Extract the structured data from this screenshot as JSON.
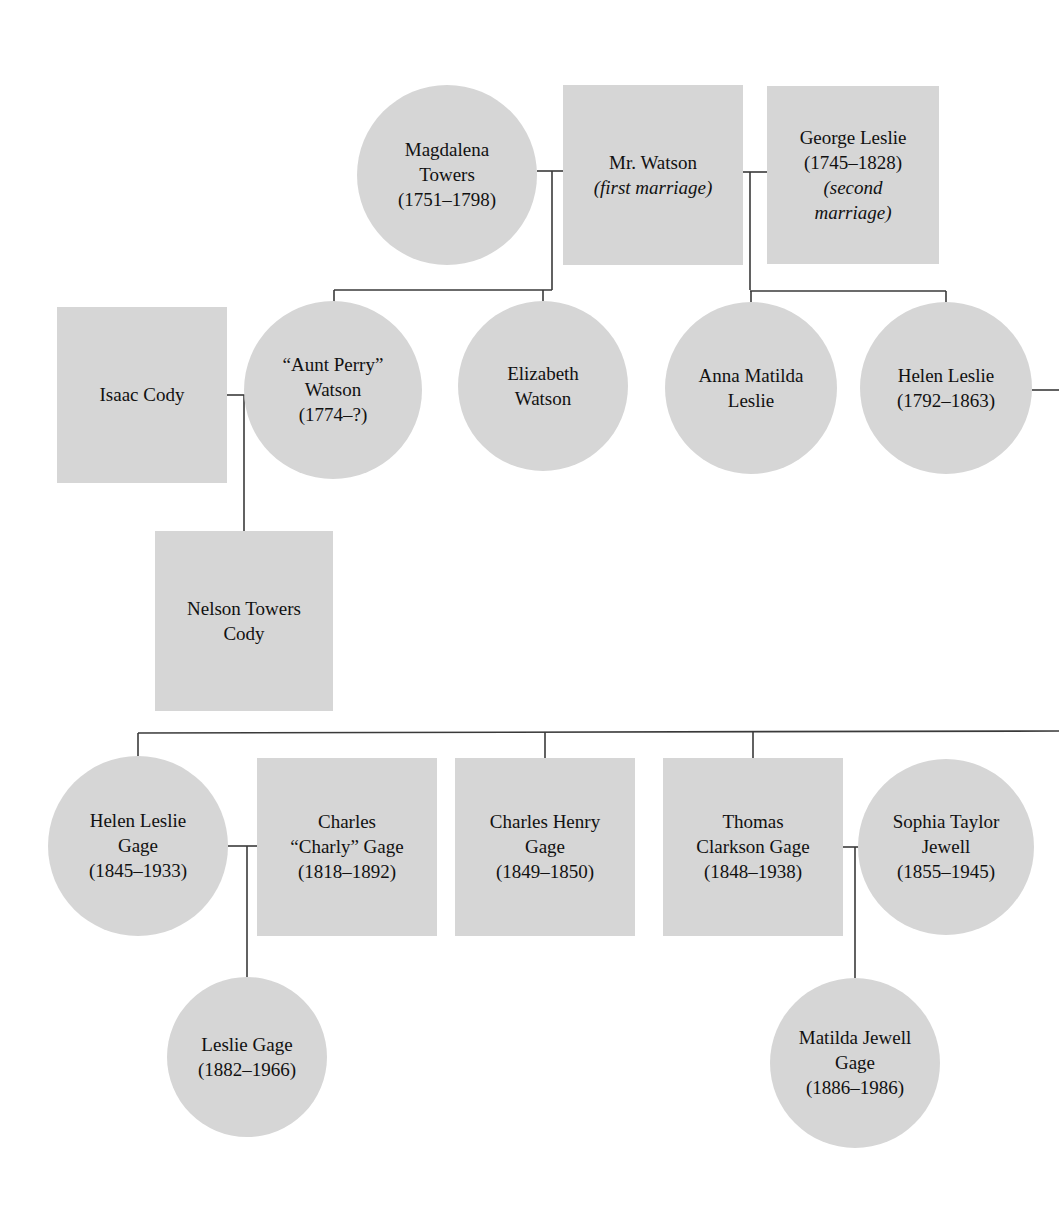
{
  "diagram": {
    "type": "genealogy-tree",
    "background_color": "#ffffff",
    "node_fill_color": "#d6d6d6",
    "connector_color": "#3a3a3a",
    "text_color": "#111111"
  },
  "nodes": [
    {
      "id": "magdalena-towers",
      "shape": "circle",
      "cx": 447,
      "cy": 175,
      "r": 90,
      "lines": [
        {
          "text": "Magdalena",
          "italic": false
        },
        {
          "text": "Towers",
          "italic": false
        },
        {
          "text": "(1751–1798)",
          "italic": false
        }
      ]
    },
    {
      "id": "mr-watson",
      "shape": "rect",
      "x": 563,
      "y": 85,
      "w": 180,
      "h": 180,
      "lines": [
        {
          "text": "Mr. Watson",
          "italic": false
        },
        {
          "text": "(first marriage)",
          "italic": true
        }
      ]
    },
    {
      "id": "george-leslie",
      "shape": "rect",
      "x": 767,
      "y": 86,
      "w": 172,
      "h": 178,
      "lines": [
        {
          "text": "George Leslie",
          "italic": false
        },
        {
          "text": "(1745–1828)",
          "italic": false
        },
        {
          "text": "(second",
          "italic": true
        },
        {
          "text": "marriage)",
          "italic": true
        }
      ]
    },
    {
      "id": "isaac-cody",
      "shape": "rect",
      "x": 57,
      "y": 307,
      "w": 170,
      "h": 176,
      "lines": [
        {
          "text": "Isaac Cody",
          "italic": false
        }
      ]
    },
    {
      "id": "aunt-perry-watson",
      "shape": "circle",
      "cx": 333,
      "cy": 390,
      "r": 89,
      "lines": [
        {
          "text": "“Aunt Perry”",
          "italic": false
        },
        {
          "text": "Watson",
          "italic": false
        },
        {
          "text": "(1774–?)",
          "italic": false
        }
      ]
    },
    {
      "id": "elizabeth-watson",
      "shape": "circle",
      "cx": 543,
      "cy": 386,
      "r": 85,
      "lines": [
        {
          "text": "Elizabeth",
          "italic": false
        },
        {
          "text": "Watson",
          "italic": false
        }
      ]
    },
    {
      "id": "anna-matilda-leslie",
      "shape": "circle",
      "cx": 751,
      "cy": 388,
      "r": 86,
      "lines": [
        {
          "text": "Anna Matilda",
          "italic": false
        },
        {
          "text": "Leslie",
          "italic": false
        }
      ]
    },
    {
      "id": "helen-leslie",
      "shape": "circle",
      "cx": 946,
      "cy": 388,
      "r": 86,
      "lines": [
        {
          "text": "Helen Leslie",
          "italic": false
        },
        {
          "text": "(1792–1863)",
          "italic": false
        }
      ]
    },
    {
      "id": "nelson-towers-cody",
      "shape": "rect",
      "x": 155,
      "y": 531,
      "w": 178,
      "h": 180,
      "lines": [
        {
          "text": "Nelson Towers",
          "italic": false
        },
        {
          "text": "Cody",
          "italic": false
        }
      ]
    },
    {
      "id": "helen-leslie-gage",
      "shape": "circle",
      "cx": 138,
      "cy": 846,
      "r": 90,
      "lines": [
        {
          "text": "Helen Leslie",
          "italic": false
        },
        {
          "text": "Gage",
          "italic": false
        },
        {
          "text": "(1845–1933)",
          "italic": false
        }
      ]
    },
    {
      "id": "charles-charly-gage",
      "shape": "rect",
      "x": 257,
      "y": 758,
      "w": 180,
      "h": 178,
      "lines": [
        {
          "text": "Charles",
          "italic": false
        },
        {
          "text": "“Charly” Gage",
          "italic": false
        },
        {
          "text": "(1818–1892)",
          "italic": false
        }
      ]
    },
    {
      "id": "charles-henry-gage",
      "shape": "rect",
      "x": 455,
      "y": 758,
      "w": 180,
      "h": 178,
      "lines": [
        {
          "text": "Charles Henry",
          "italic": false
        },
        {
          "text": "Gage",
          "italic": false
        },
        {
          "text": "(1849–1850)",
          "italic": false
        }
      ]
    },
    {
      "id": "thomas-clarkson-gage",
      "shape": "rect",
      "x": 663,
      "y": 758,
      "w": 180,
      "h": 178,
      "lines": [
        {
          "text": "Thomas",
          "italic": false
        },
        {
          "text": "Clarkson Gage",
          "italic": false
        },
        {
          "text": "(1848–1938)",
          "italic": false
        }
      ]
    },
    {
      "id": "sophia-taylor-jewell",
      "shape": "circle",
      "cx": 946,
      "cy": 847,
      "r": 88,
      "lines": [
        {
          "text": "Sophia Taylor",
          "italic": false
        },
        {
          "text": "Jewell",
          "italic": false
        },
        {
          "text": "(1855–1945)",
          "italic": false
        }
      ]
    },
    {
      "id": "leslie-gage",
      "shape": "circle",
      "cx": 247,
      "cy": 1057,
      "r": 80,
      "lines": [
        {
          "text": "Leslie Gage",
          "italic": false
        },
        {
          "text": "(1882–1966)",
          "italic": false
        }
      ]
    },
    {
      "id": "matilda-jewell-gage",
      "shape": "circle",
      "cx": 855,
      "cy": 1063,
      "r": 85,
      "lines": [
        {
          "text": "Matilda Jewell",
          "italic": false
        },
        {
          "text": "Gage",
          "italic": false
        },
        {
          "text": "(1886–1986)",
          "italic": false
        }
      ]
    }
  ],
  "connectors": [
    {
      "id": "marriage-magdalena-watson",
      "d": "M 537 171 L 563 171"
    },
    {
      "id": "marriage-watson-drop",
      "d": "M 552 171 L 552 290"
    },
    {
      "id": "marriage-watson-george",
      "d": "M 742 172 L 767 172"
    },
    {
      "id": "marriage-george-drop",
      "d": "M 750 172 L 750 290"
    },
    {
      "id": "watson-children-bar",
      "d": "M 334 290 L 552 290"
    },
    {
      "id": "watson-child-aunt-perry-drop",
      "d": "M 334 290 L 334 303"
    },
    {
      "id": "watson-child-elizabeth-drop",
      "d": "M 543 290 L 543 302"
    },
    {
      "id": "leslie-children-bar",
      "d": "M 750 291 L 946 291"
    },
    {
      "id": "leslie-child-anna-drop",
      "d": "M 751 291 L 751 303"
    },
    {
      "id": "leslie-child-helen-drop",
      "d": "M 946 291 L 946 303"
    },
    {
      "id": "helen-leslie-right-stub",
      "d": "M 1032 390 L 1059 390"
    },
    {
      "id": "marriage-isaac-auntperry",
      "d": "M 227 395 L 245 395"
    },
    {
      "id": "marriage-cody-drop",
      "d": "M 244 395 L 244 531"
    },
    {
      "id": "gage-children-bar",
      "d": "M 138 733 L 1059 731"
    },
    {
      "id": "gage-child-helen-drop",
      "d": "M 138 733 L 138 758"
    },
    {
      "id": "gage-child-charlesh-drop",
      "d": "M 545 732 L 545 758"
    },
    {
      "id": "gage-child-thomas-drop",
      "d": "M 753 732 L 753 758"
    },
    {
      "id": "marriage-helengage-charly",
      "d": "M 228 846 L 257 846"
    },
    {
      "id": "marriage-charly-drop",
      "d": "M 247 846 L 247 978"
    },
    {
      "id": "marriage-thomas-sophia",
      "d": "M 843 847 L 866 847"
    },
    {
      "id": "marriage-thomas-sophia-drop",
      "d": "M 855 847 L 855 980"
    }
  ]
}
